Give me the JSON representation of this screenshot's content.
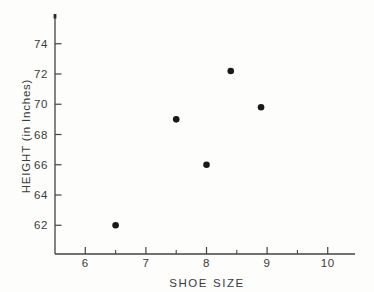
{
  "chart_data": {
    "type": "scatter",
    "title": "",
    "xlabel": "SHOE SIZE",
    "ylabel": "HEIGHT (in Inches)",
    "points": [
      {
        "x": 6.5,
        "y": 62
      },
      {
        "x": 7.5,
        "y": 69
      },
      {
        "x": 8.0,
        "y": 66
      },
      {
        "x": 8.4,
        "y": 72.2
      },
      {
        "x": 8.9,
        "y": 69.8
      }
    ],
    "xlim": [
      5.5,
      10.45
    ],
    "ylim": [
      60.1,
      75.9
    ],
    "x_major_ticks": [
      6,
      7,
      8,
      9,
      10
    ],
    "x_minor_ticks": [
      6.5,
      7.5,
      8.5,
      9.5
    ],
    "y_major_ticks": [
      74,
      72,
      70,
      68,
      66,
      64,
      62
    ],
    "grid": false,
    "legend": "none",
    "marker": "filled-circle",
    "colors": {
      "axis": "#434343",
      "text": "#3a3a3a",
      "marker": "#191919",
      "background": "#fdfdfc"
    }
  }
}
